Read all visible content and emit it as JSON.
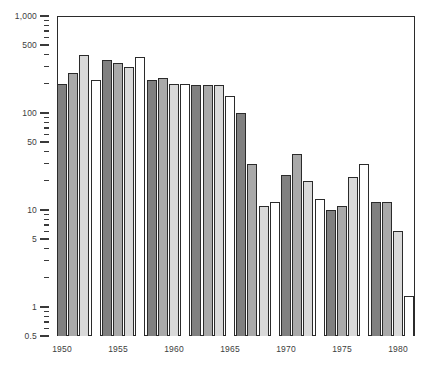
{
  "chart_data": {
    "type": "bar",
    "title": "",
    "subtitle": "",
    "xlabel": "",
    "ylabel": "",
    "scale": "log",
    "grid": false,
    "legend": false,
    "ylim": [
      0.5,
      1000
    ],
    "y_major_ticks": [
      1000,
      500,
      100,
      50,
      10,
      5,
      1,
      0.5
    ],
    "y_tick_labels": [
      "1,000",
      "500",
      "100",
      "50",
      "10",
      "5",
      "1",
      "0.5"
    ],
    "x_tick_labels": [
      "1950",
      "1955",
      "1960",
      "1965",
      "1970",
      "1975",
      "1980"
    ],
    "x_tick_years": [
      1950,
      1955,
      1960,
      1965,
      1970,
      1975,
      1980
    ],
    "bar_palette": [
      "#808080",
      "#a9a9a9",
      "#d9d9d9",
      "#ffffff"
    ],
    "bar_outline": "#2b2b2b",
    "categories": [
      1950,
      1951,
      1952,
      1953,
      1954,
      1955,
      1956,
      1957,
      1958,
      1959,
      1960,
      1961,
      1962,
      1963,
      1964,
      1965,
      1966,
      1967,
      1968,
      1969,
      1970,
      1971,
      1972,
      1973,
      1974,
      1975,
      1976,
      1977,
      1978,
      1979,
      1980,
      1981
    ],
    "values": [
      200,
      260,
      400,
      220,
      350,
      330,
      300,
      380,
      220,
      230,
      200,
      200,
      195,
      195,
      195,
      150,
      100,
      30,
      11,
      12,
      23,
      38,
      20,
      13,
      10,
      11,
      22,
      30,
      12,
      12,
      6,
      1.3
    ]
  },
  "axes": {
    "y": {
      "ticks": [
        {
          "value": 1000,
          "label": "1,000",
          "major": true
        },
        {
          "value": 900,
          "label": "",
          "major": false
        },
        {
          "value": 800,
          "label": "",
          "major": false
        },
        {
          "value": 700,
          "label": "",
          "major": false
        },
        {
          "value": 600,
          "label": "",
          "major": false
        },
        {
          "value": 500,
          "label": "500",
          "major": true
        },
        {
          "value": 400,
          "label": "",
          "major": false
        },
        {
          "value": 300,
          "label": "",
          "major": false
        },
        {
          "value": 200,
          "label": "",
          "major": false
        },
        {
          "value": 100,
          "label": "100",
          "major": true
        },
        {
          "value": 90,
          "label": "",
          "major": false
        },
        {
          "value": 80,
          "label": "",
          "major": false
        },
        {
          "value": 70,
          "label": "",
          "major": false
        },
        {
          "value": 60,
          "label": "",
          "major": false
        },
        {
          "value": 50,
          "label": "50",
          "major": true
        },
        {
          "value": 40,
          "label": "",
          "major": false
        },
        {
          "value": 30,
          "label": "",
          "major": false
        },
        {
          "value": 20,
          "label": "",
          "major": false
        },
        {
          "value": 10,
          "label": "10",
          "major": true
        },
        {
          "value": 9,
          "label": "",
          "major": false
        },
        {
          "value": 8,
          "label": "",
          "major": false
        },
        {
          "value": 7,
          "label": "",
          "major": false
        },
        {
          "value": 6,
          "label": "",
          "major": false
        },
        {
          "value": 5,
          "label": "5",
          "major": true
        },
        {
          "value": 4,
          "label": "",
          "major": false
        },
        {
          "value": 3,
          "label": "",
          "major": false
        },
        {
          "value": 2,
          "label": "",
          "major": false
        },
        {
          "value": 1,
          "label": "1",
          "major": true
        },
        {
          "value": 0.9,
          "label": "",
          "major": false
        },
        {
          "value": 0.8,
          "label": "",
          "major": false
        },
        {
          "value": 0.7,
          "label": "",
          "major": false
        },
        {
          "value": 0.6,
          "label": "",
          "major": false
        },
        {
          "value": 0.5,
          "label": "0.5",
          "major": true
        }
      ]
    },
    "x": {
      "ticks": [
        {
          "year": 1950,
          "label": "1950"
        },
        {
          "year": 1955,
          "label": "1955"
        },
        {
          "year": 1960,
          "label": "1960"
        },
        {
          "year": 1965,
          "label": "1965"
        },
        {
          "year": 1970,
          "label": "1970"
        },
        {
          "year": 1975,
          "label": "1975"
        },
        {
          "year": 1980,
          "label": "1980"
        }
      ]
    }
  },
  "geometry": {
    "plot_left": 57,
    "plot_top": 16,
    "plot_width": 358,
    "plot_height": 320,
    "bar_pitch": 11.2,
    "bar_gap": 1.2
  }
}
